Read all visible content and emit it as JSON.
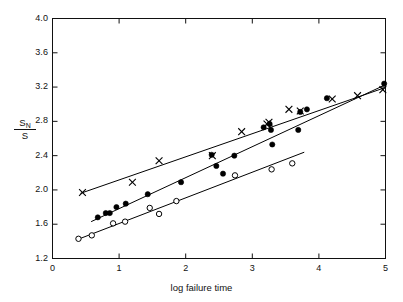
{
  "chart_data": {
    "type": "scatter",
    "title": "",
    "xlabel": "log failure time",
    "ylabel": "S_N / S",
    "ylabel_numerator": "S",
    "ylabel_numerator_sub": "N",
    "ylabel_denominator": "S",
    "xlim": [
      0,
      5
    ],
    "ylim": [
      1.2,
      4.0
    ],
    "xticks": [
      0,
      1,
      2,
      3,
      4,
      5
    ],
    "xtick_labels": [
      "0",
      "1",
      "2",
      "3",
      "4",
      "5"
    ],
    "yticks": [
      1.2,
      1.6,
      2.0,
      2.4,
      2.8,
      3.2,
      3.6,
      4.0
    ],
    "ytick_labels": [
      "1.2",
      "1.6",
      "2.0",
      "2.4",
      "2.8",
      "3.2",
      "3.6",
      "4.0"
    ],
    "grid": false,
    "legend": "none",
    "series": [
      {
        "name": "cross-series",
        "marker": "x",
        "color": "#000000",
        "points": [
          [
            0.45,
            1.97
          ],
          [
            1.2,
            2.09
          ],
          [
            1.6,
            2.34
          ],
          [
            2.4,
            2.4
          ],
          [
            2.84,
            2.68
          ],
          [
            3.22,
            2.77
          ],
          [
            3.25,
            2.79
          ],
          [
            3.55,
            2.94
          ],
          [
            3.72,
            2.92
          ],
          [
            4.2,
            3.06
          ],
          [
            4.58,
            3.1
          ],
          [
            4.96,
            3.17
          ]
        ],
        "fit_line": {
          "x0": 0.42,
          "y0": 1.96,
          "x1": 4.98,
          "y1": 3.19
        }
      },
      {
        "name": "filled-circle-series",
        "marker": "filled-circle",
        "color": "#000000",
        "points": [
          [
            0.68,
            1.68
          ],
          [
            0.8,
            1.73
          ],
          [
            0.86,
            1.73
          ],
          [
            0.96,
            1.8
          ],
          [
            1.1,
            1.84
          ],
          [
            1.43,
            1.95
          ],
          [
            1.93,
            2.09
          ],
          [
            2.39,
            2.41
          ],
          [
            2.46,
            2.28
          ],
          [
            2.56,
            2.19
          ],
          [
            2.73,
            2.4
          ],
          [
            3.17,
            2.73
          ],
          [
            3.26,
            2.77
          ],
          [
            3.28,
            2.7
          ],
          [
            3.3,
            2.53
          ],
          [
            3.69,
            2.7
          ],
          [
            3.72,
            2.91
          ],
          [
            3.82,
            2.94
          ],
          [
            4.12,
            3.07
          ],
          [
            4.98,
            3.24
          ]
        ],
        "fit_line": {
          "x0": 0.58,
          "y0": 1.63,
          "x1": 4.98,
          "y1": 3.22
        }
      },
      {
        "name": "open-circle-series",
        "marker": "open-circle",
        "color": "#000000",
        "points": [
          [
            0.39,
            1.43
          ],
          [
            0.59,
            1.47
          ],
          [
            0.91,
            1.61
          ],
          [
            1.09,
            1.63
          ],
          [
            1.46,
            1.79
          ],
          [
            1.6,
            1.72
          ],
          [
            1.86,
            1.87
          ],
          [
            2.74,
            2.17
          ],
          [
            3.29,
            2.24
          ],
          [
            3.6,
            2.31
          ]
        ],
        "fit_line": {
          "x0": 0.37,
          "y0": 1.42,
          "x1": 3.78,
          "y1": 2.44
        }
      }
    ]
  },
  "axes": {
    "frame_color": "#111111"
  }
}
